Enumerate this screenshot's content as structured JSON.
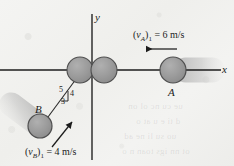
{
  "figure": {
    "background_color": "#f2f2f0",
    "ink_color": "#1c1c1c",
    "ball_fill": "#9a9a9a",
    "ball_stroke": "#4a4a4a",
    "blur_trail_color": "#b9b9b9"
  },
  "axes": {
    "x_label": "x",
    "y_label": "y",
    "origin": {
      "x": 92,
      "y": 70
    }
  },
  "balls": [
    {
      "id": "ball-a",
      "label": "A",
      "cx": 173,
      "cy": 70,
      "r": 13,
      "trail_direction": "right"
    },
    {
      "id": "ball-b",
      "label": "B",
      "cx": 40,
      "cy": 126,
      "r": 12,
      "trail_direction": "down-left"
    },
    {
      "id": "ball-origin-left",
      "label": "",
      "cx": 80,
      "cy": 70,
      "r": 13,
      "trail_direction": "none"
    },
    {
      "id": "ball-origin-right",
      "label": "",
      "cx": 104,
      "cy": 70,
      "r": 13,
      "trail_direction": "none"
    }
  ],
  "velocities": [
    {
      "id": "velocity-a",
      "symbol": "v",
      "subscript_body": "A",
      "subscript_state": "1",
      "value": "6",
      "units": "m/s",
      "equals": "=",
      "open_paren": "(",
      "close_paren": ")",
      "arrow_direction": "left"
    },
    {
      "id": "velocity-b",
      "symbol": "v",
      "subscript_body": "B",
      "subscript_state": "1",
      "value": "4",
      "units": "m/s",
      "equals": "=",
      "open_paren": "(",
      "close_paren": ")",
      "arrow_direction": "up-right"
    }
  ],
  "slope_triangle": {
    "hypotenuse": "5",
    "vertical": "4",
    "horizontal": "3"
  },
  "bleed_through": {
    "line1": "ue cu nc ol on",
    "line2": "d ti e u at o",
    "line3": "uo su li ne ad",
    "line4": "ot nn igs toan n o"
  }
}
